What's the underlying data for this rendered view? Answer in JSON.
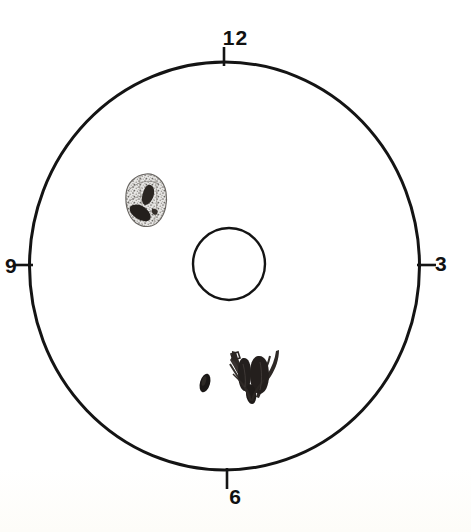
{
  "diagram": {
    "kind": "clock-face-circular-diagram",
    "background_color": "#ffffff",
    "ink_color": "#111111",
    "position_labels": [
      {
        "id": "12",
        "text": "12",
        "angle_deg": 0,
        "placement": "top"
      },
      {
        "id": "3",
        "text": "3",
        "angle_deg": 90,
        "placement": "right"
      },
      {
        "id": "6",
        "text": "6",
        "angle_deg": 180,
        "placement": "bottom"
      },
      {
        "id": "9",
        "text": "9",
        "angle_deg": 270,
        "placement": "left"
      }
    ],
    "outer_circle": {
      "name": "outer-boundary-circle",
      "center_x": 224.5,
      "center_y": 266,
      "radius_x": 195,
      "radius_y": 204,
      "stroke_width": 3,
      "stroke_color": "#141414",
      "fill": "none"
    },
    "center_circle": {
      "name": "center-circle",
      "center_x": 229,
      "center_y": 264,
      "radius_x": 36,
      "radius_y": 36,
      "stroke_width": 2.4,
      "stroke_color": "#141414",
      "fill": "none"
    },
    "tick_marks": [
      {
        "id": "tick-12",
        "x1": 224,
        "y1": 47,
        "x2": 224,
        "y2": 66,
        "orientation": "vertical"
      },
      {
        "id": "tick-3",
        "x1": 417,
        "y1": 265,
        "x2": 436,
        "y2": 265,
        "orientation": "horizontal"
      },
      {
        "id": "tick-6",
        "x1": 227,
        "y1": 468,
        "x2": 227,
        "y2": 489,
        "orientation": "vertical"
      },
      {
        "id": "tick-9",
        "x1": 14,
        "y1": 265,
        "x2": 33,
        "y2": 265,
        "orientation": "horizontal"
      }
    ],
    "marked_features": [
      {
        "id": "feature-upper-left",
        "name": "speckled-oval-lesion",
        "description": "Irregular stippled grey oval with dark angular inclusions",
        "center_x": 146,
        "center_y": 199,
        "width": 38,
        "height": 52,
        "rotation_deg": -14,
        "fill_color": "#b8b6b2",
        "detail_color": "#2b2622",
        "clock_position": "10-11 o'clock"
      },
      {
        "id": "feature-small-ellipse",
        "name": "small-dark-ellipse-mark",
        "description": "Small solid dark slanted ellipse",
        "center_x": 205,
        "center_y": 383,
        "width": 10,
        "height": 19,
        "rotation_deg": 16,
        "fill_color": "#1a1716",
        "clock_position": "6 o'clock inner"
      },
      {
        "id": "feature-lower-center",
        "name": "antler-shaped-dark-mark",
        "description": "Dark splayed antler / arrow shaped mark with prongs",
        "center_x": 254,
        "center_y": 376,
        "width": 48,
        "height": 56,
        "rotation_deg": 0,
        "fill_color": "#272220",
        "clock_position": "6 o'clock"
      }
    ]
  }
}
